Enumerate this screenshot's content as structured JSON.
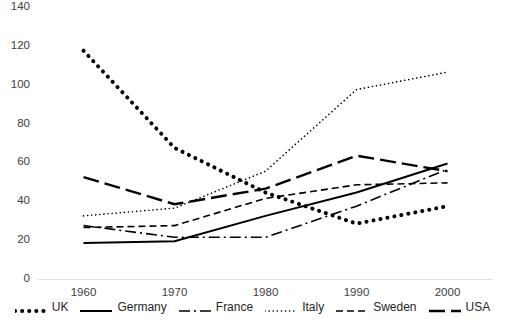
{
  "chart_data": {
    "type": "line",
    "title": "",
    "xlabel": "",
    "ylabel": "",
    "x": [
      1960,
      1970,
      1980,
      1990,
      2000
    ],
    "categories": [
      "1960",
      "1970",
      "1980",
      "1990",
      "2000"
    ],
    "xlim": [
      1955,
      2005
    ],
    "ylim": [
      0,
      140
    ],
    "yticks": [
      0,
      20,
      40,
      60,
      80,
      100,
      120,
      140
    ],
    "xticks": [
      "1960",
      "1970",
      "1980",
      "1990",
      "2000"
    ],
    "grid": false,
    "legend_position": "bottom",
    "series": [
      {
        "name": "UK",
        "values": [
          118,
          68,
          45,
          29,
          38
        ],
        "color": "#000000",
        "style": "dotted-thick"
      },
      {
        "name": "Germany",
        "values": [
          19,
          20,
          33,
          45,
          60
        ],
        "color": "#000000",
        "style": "solid"
      },
      {
        "name": "France",
        "values": [
          28,
          22,
          22,
          38,
          57
        ],
        "color": "#000000",
        "style": "dash-dot"
      },
      {
        "name": "Italy",
        "values": [
          33,
          37,
          56,
          98,
          107
        ],
        "color": "#000000",
        "style": "dotted-fine"
      },
      {
        "name": "Sweden",
        "values": [
          27,
          28,
          42,
          49,
          50
        ],
        "color": "#000000",
        "style": "dashed-short"
      },
      {
        "name": "USA",
        "values": [
          53,
          39,
          47,
          64,
          56
        ],
        "color": "#000000",
        "style": "dashed-long"
      }
    ]
  },
  "legend": {
    "items": [
      {
        "label": "UK"
      },
      {
        "label": "Germany"
      },
      {
        "label": "France"
      },
      {
        "label": "Italy"
      },
      {
        "label": "Sweden"
      },
      {
        "label": "USA"
      }
    ]
  }
}
